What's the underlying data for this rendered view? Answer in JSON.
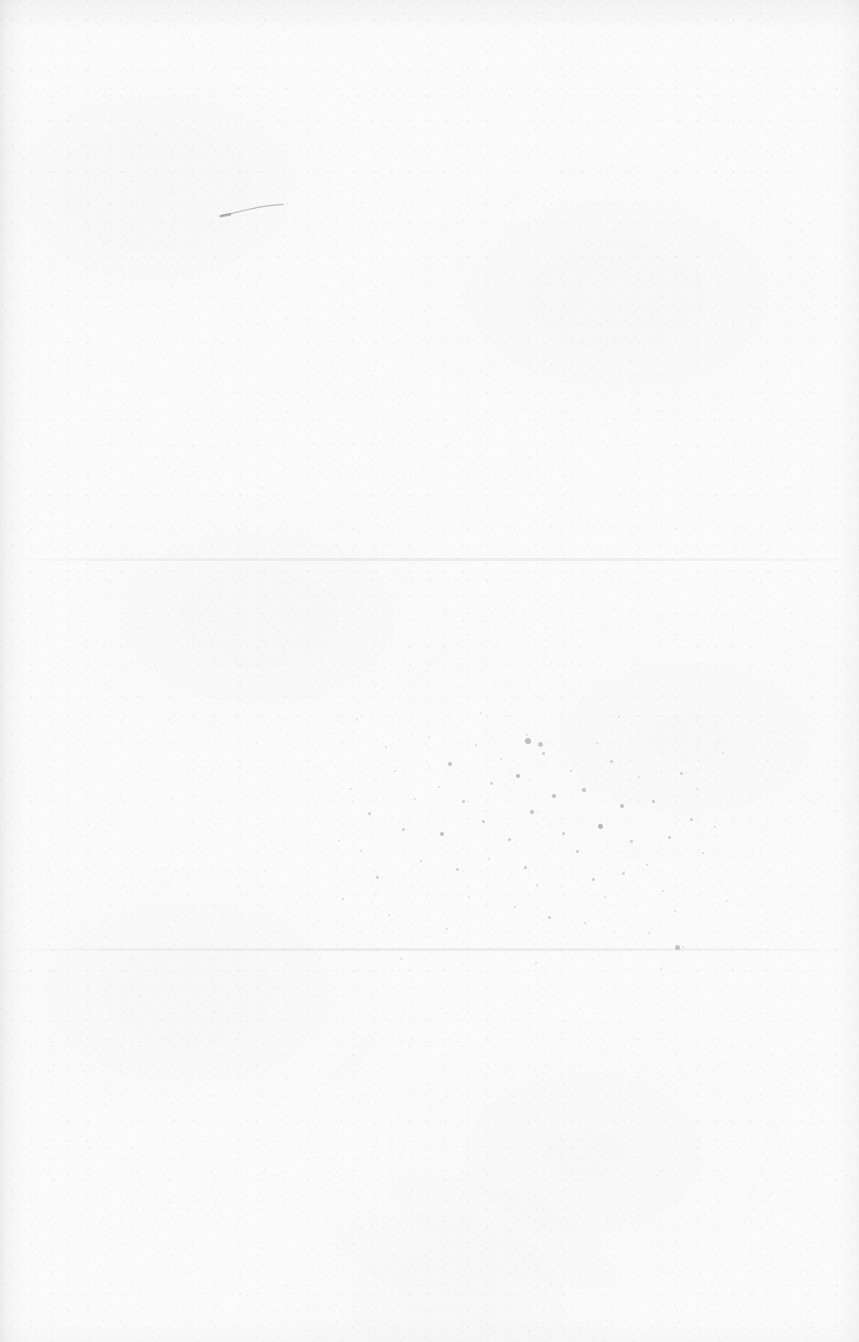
{
  "page": {
    "label": "blank scanned sheet",
    "width": 859,
    "height": 1342,
    "paper_color": "#fbfbfb",
    "caption": ""
  },
  "artifacts": {
    "pen_stroke": {
      "name": "faint pen stroke",
      "color": "#9a9aa0",
      "x": 218,
      "y": 198,
      "width": 68,
      "height": 24
    },
    "creases": [
      {
        "name": "upper crease line",
        "y": 558,
        "color": "#000000"
      },
      {
        "name": "lower crease line",
        "y": 948,
        "color": "#000000"
      }
    ],
    "spatter": {
      "name": "ink spatter field",
      "color": "#8e8e93",
      "x": 330,
      "y": 700,
      "width": 400,
      "height": 280,
      "specks": [
        [
          38,
          112,
          1.6,
          0.42
        ],
        [
          55,
          46,
          1.1,
          0.3
        ],
        [
          72,
          128,
          1.3,
          0.36
        ],
        [
          20,
          88,
          1.0,
          0.26
        ],
        [
          90,
          160,
          1.2,
          0.34
        ],
        [
          46,
          176,
          1.4,
          0.38
        ],
        [
          64,
          70,
          0.9,
          0.24
        ],
        [
          30,
          150,
          1.1,
          0.3
        ],
        [
          84,
          98,
          1.0,
          0.28
        ],
        [
          12,
          198,
          1.2,
          0.3
        ],
        [
          58,
          214,
          1.0,
          0.26
        ],
        [
          98,
          36,
          0.9,
          0.22
        ],
        [
          118,
          62,
          1.8,
          0.5
        ],
        [
          132,
          100,
          1.5,
          0.44
        ],
        [
          110,
          132,
          2.0,
          0.55
        ],
        [
          145,
          44,
          1.2,
          0.34
        ],
        [
          126,
          168,
          1.3,
          0.36
        ],
        [
          152,
          120,
          1.7,
          0.46
        ],
        [
          108,
          86,
          1.1,
          0.3
        ],
        [
          160,
          82,
          1.4,
          0.38
        ],
        [
          138,
          196,
          1.0,
          0.26
        ],
        [
          116,
          228,
          1.2,
          0.3
        ],
        [
          158,
          158,
          1.1,
          0.28
        ],
        [
          170,
          58,
          1.0,
          0.26
        ],
        [
          186,
          74,
          2.2,
          0.58
        ],
        [
          200,
          110,
          1.9,
          0.52
        ],
        [
          178,
          138,
          1.6,
          0.46
        ],
        [
          212,
          52,
          1.4,
          0.4
        ],
        [
          194,
          166,
          1.7,
          0.48
        ],
        [
          222,
          94,
          2.0,
          0.54
        ],
        [
          206,
          184,
          1.2,
          0.32
        ],
        [
          232,
          132,
          1.5,
          0.42
        ],
        [
          184,
          206,
          1.1,
          0.28
        ],
        [
          218,
          216,
          1.3,
          0.34
        ],
        [
          240,
          70,
          1.2,
          0.32
        ],
        [
          196,
          34,
          1.0,
          0.26
        ],
        [
          252,
          88,
          1.8,
          0.5
        ],
        [
          268,
          124,
          2.4,
          0.62
        ],
        [
          246,
          150,
          1.6,
          0.44
        ],
        [
          280,
          60,
          1.3,
          0.36
        ],
        [
          262,
          178,
          1.5,
          0.42
        ],
        [
          290,
          104,
          1.9,
          0.52
        ],
        [
          274,
          196,
          1.1,
          0.3
        ],
        [
          300,
          140,
          1.4,
          0.38
        ],
        [
          254,
          222,
          1.2,
          0.3
        ],
        [
          292,
          172,
          1.3,
          0.34
        ],
        [
          308,
          76,
          1.1,
          0.28
        ],
        [
          266,
          42,
          1.0,
          0.26
        ],
        [
          322,
          100,
          1.7,
          0.46
        ],
        [
          338,
          136,
          1.4,
          0.4
        ],
        [
          316,
          164,
          1.2,
          0.34
        ],
        [
          350,
          72,
          1.3,
          0.36
        ],
        [
          332,
          190,
          1.1,
          0.3
        ],
        [
          360,
          118,
          1.5,
          0.4
        ],
        [
          344,
          210,
          1.0,
          0.26
        ],
        [
          372,
          152,
          1.2,
          0.32
        ],
        [
          318,
          232,
          0.9,
          0.24
        ],
        [
          366,
          88,
          1.1,
          0.28
        ],
        [
          384,
          126,
          1.0,
          0.26
        ],
        [
          352,
          246,
          0.9,
          0.22
        ],
        [
          26,
          18,
          0.9,
          0.22
        ],
        [
          150,
          12,
          1.0,
          0.24
        ],
        [
          288,
          16,
          0.9,
          0.22
        ],
        [
          70,
          258,
          1.0,
          0.24
        ],
        [
          205,
          262,
          1.1,
          0.26
        ],
        [
          330,
          268,
          0.9,
          0.22
        ],
        [
          392,
          52,
          0.9,
          0.22
        ],
        [
          8,
          140,
          0.9,
          0.22
        ],
        [
          396,
          200,
          1.0,
          0.24
        ],
        [
          195,
          38,
          3.0,
          0.55
        ],
        [
          208,
          42,
          2.4,
          0.48
        ],
        [
          345,
          245,
          2.6,
          0.5
        ]
      ]
    }
  }
}
